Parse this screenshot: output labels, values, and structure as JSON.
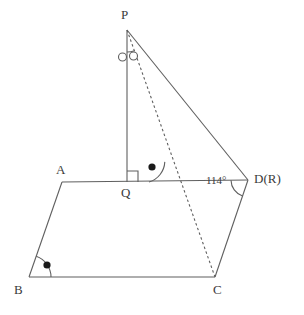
{
  "figure": {
    "canvas": {
      "width": 304,
      "height": 315
    },
    "stroke_color": "#5f5f5f",
    "label_color": "#3b3b3b",
    "background_color": "#ffffff",
    "stroke_width": 1.1,
    "dash_pattern": "2.5 2.5"
  },
  "points": {
    "P": {
      "label": "P",
      "x": 127,
      "y": 30,
      "label_x": 121,
      "label_y": 8
    },
    "Q": {
      "label": "Q",
      "x": 127,
      "y": 182,
      "label_x": 121,
      "label_y": 186
    },
    "A": {
      "label": "A",
      "x": 62,
      "y": 182,
      "label_x": 56,
      "label_y": 163
    },
    "B": {
      "label": "B",
      "x": 29,
      "y": 277,
      "label_x": 14,
      "label_y": 283
    },
    "C": {
      "label": "C",
      "x": 215,
      "y": 277,
      "label_x": 213,
      "label_y": 283
    },
    "D": {
      "label": "D(R)",
      "x": 248,
      "y": 180,
      "label_x": 254,
      "label_y": 172
    },
    "X": {
      "label": "",
      "x": 171,
      "y": 182,
      "label_x": 0,
      "label_y": 0
    }
  },
  "segments": [
    {
      "name": "segment-PQ",
      "from": "P",
      "to": "Q",
      "style": "solid"
    },
    {
      "name": "segment-PD",
      "from": "P",
      "to": "D",
      "style": "solid"
    },
    {
      "name": "segment-AD",
      "from": "A",
      "to": "D",
      "style": "solid"
    },
    {
      "name": "segment-AB",
      "from": "A",
      "to": "B",
      "style": "solid"
    },
    {
      "name": "segment-BC",
      "from": "B",
      "to": "C",
      "style": "solid"
    },
    {
      "name": "segment-CD",
      "from": "C",
      "to": "D",
      "style": "solid"
    },
    {
      "name": "segment-PC",
      "from": "P",
      "to": "C",
      "style": "dashed"
    }
  ],
  "angle_marks": [
    {
      "name": "right-angle-mark-Q",
      "vertex": "Q",
      "type": "right-angle-square",
      "size": 11,
      "orientation": "up-right"
    },
    {
      "name": "angle-arc-P",
      "vertex": "P",
      "type": "arc",
      "radius": 22,
      "decorator": "double-open-circle",
      "decorator_symbol": "○",
      "decorator_count": 2
    },
    {
      "name": "angle-arc-crossing-AD-PC",
      "vertex": "X",
      "type": "arc",
      "radius": 22,
      "decorator": "filled-dot",
      "decorator_symbol": "●",
      "decorator_count": 1
    },
    {
      "name": "angle-arc-B",
      "vertex": "B",
      "type": "arc",
      "radius": 22,
      "decorator": "filled-dot",
      "decorator_symbol": "●",
      "decorator_count": 1
    },
    {
      "name": "angle-arc-D",
      "vertex": "D",
      "type": "arc",
      "radius": 17,
      "decorator": "none",
      "decorator_count": 0,
      "value_text": "114°",
      "value_label_x": 206,
      "value_label_y": 175
    }
  ]
}
